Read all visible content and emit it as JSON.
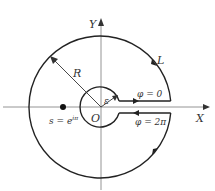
{
  "diagram": {
    "type": "contour-in-complex-plane",
    "axes": {
      "x_label": "X",
      "y_label": "Y",
      "origin_label": "O"
    },
    "outer_circle": {
      "label": "L",
      "radius_label": "R"
    },
    "inner_circle": {
      "radius_label": "ε"
    },
    "branch_cut": {
      "upper_label": "φ = 0",
      "lower_label": "φ = 2π"
    },
    "point": {
      "label_base": "s = e",
      "label_exponent": "iπ",
      "label_exponent_uncertain": true
    }
  }
}
